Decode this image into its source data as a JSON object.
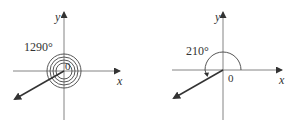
{
  "diagrams": [
    {
      "angle_label": "1290°",
      "origin_label": "0",
      "x_axis_label": "x",
      "y_axis_label": "y",
      "angle_degrees": 1290
    },
    {
      "angle_label": "210°",
      "origin_label": "0",
      "x_axis_label": "x",
      "y_axis_label": "y",
      "angle_degrees": 210
    }
  ],
  "colors": {
    "axis": "#555555",
    "arrow": "#333333",
    "arc": "#444444"
  }
}
